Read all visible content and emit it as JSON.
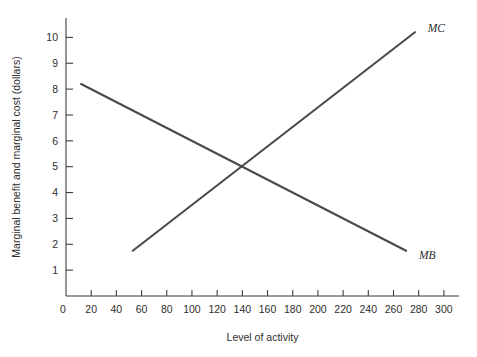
{
  "chart_data": {
    "type": "line",
    "title": "",
    "subtitle": "",
    "xlabel": "Level of activity",
    "ylabel": "Marginal benefit and marginal cost (dollars)",
    "xlim": [
      0,
      312
    ],
    "ylim": [
      0,
      10.75
    ],
    "grid": false,
    "legend_position": "inline-end-of-line",
    "x_ticks": [
      20,
      40,
      60,
      80,
      100,
      120,
      140,
      160,
      180,
      200,
      220,
      240,
      260,
      280,
      300
    ],
    "x_tick_labels": [
      "20",
      "40",
      "60",
      "80",
      "100",
      "120",
      "140",
      "160",
      "180",
      "200",
      "220",
      "240",
      "260",
      "280",
      "300"
    ],
    "y_ticks": [
      1,
      2,
      3,
      4,
      5,
      6,
      7,
      8,
      9,
      10
    ],
    "y_tick_labels": [
      "1",
      "2",
      "3",
      "4",
      "5",
      "6",
      "7",
      "8",
      "9",
      "10"
    ],
    "origin_label": "0",
    "series": [
      {
        "name": "MB",
        "label": "MB",
        "color": "#4a4a4a",
        "points": [
          [
            12,
            8.2
          ],
          [
            270,
            1.75
          ]
        ],
        "label_point": [
          277,
          1.6
        ],
        "description": "Marginal benefit, downward sloping"
      },
      {
        "name": "MC",
        "label": "MC",
        "color": "#4a4a4a",
        "points": [
          [
            53,
            1.75
          ],
          [
            277,
            10.2
          ]
        ],
        "label_point": [
          284,
          10.35
        ],
        "description": "Marginal cost, upward sloping"
      }
    ],
    "annotations": [
      {
        "name": "intersection",
        "x": 140,
        "y": 5.0,
        "text": ""
      }
    ]
  },
  "colors": {
    "axis": "#3d3d3d",
    "text": "#2e2e2e",
    "curve": "#4a4a4a",
    "background": "#ffffff"
  }
}
